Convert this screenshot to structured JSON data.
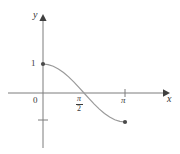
{
  "figure": {
    "background_color": "#ffffff",
    "axis_color": "#7d7d7d",
    "curve_color": "#9a9a9a",
    "point_color": "#4a4a4a",
    "text_color": "#3a3a3a"
  },
  "labels": {
    "y_axis": "y",
    "x_axis": "x",
    "origin": "0",
    "y_tick_one": "1",
    "x_tick_pi": "π",
    "x_tick_pi_over_2_numerator": "π",
    "x_tick_pi_over_2_denominator": "2"
  },
  "chart_data": {
    "type": "line",
    "title": "",
    "xlabel": "x",
    "ylabel": "y",
    "xlim": [
      -0.55,
      2.1
    ],
    "ylim": [
      -1.65,
      1.5
    ],
    "grid": false,
    "legend": "none",
    "function": "y = cos(x)",
    "x_tick_labels": [
      "0",
      "π/2",
      "π"
    ],
    "x_tick_values": [
      0,
      1.5707963,
      3.1415927
    ],
    "y_tick_labels": [
      "1",
      ""
    ],
    "y_tick_values": [
      1,
      -1
    ],
    "series": [
      {
        "name": "cos(x)",
        "x": [
          0.0,
          0.19634954,
          0.39269908,
          0.58904862,
          0.78539816,
          0.9817477,
          1.17809725,
          1.37444679,
          1.57079633,
          1.76714587,
          1.96349541,
          2.15984495,
          2.35619449,
          2.55254403,
          2.74889357,
          2.94524311,
          3.14159265
        ],
        "y": [
          1.0,
          0.98078528,
          0.92387953,
          0.83146961,
          0.70710678,
          0.55557023,
          0.38268343,
          0.19509032,
          0.0,
          -0.19509032,
          -0.38268343,
          -0.55557023,
          -0.70710678,
          -0.83146961,
          -0.92387953,
          -0.98078528,
          -1.0
        ]
      }
    ],
    "annotations": [
      {
        "name": "endpoint-start",
        "x": 0,
        "y": 1,
        "marker": "filled-dot"
      },
      {
        "name": "endpoint-finish",
        "x": 3.1415927,
        "y": -1,
        "marker": "filled-dot"
      }
    ]
  }
}
